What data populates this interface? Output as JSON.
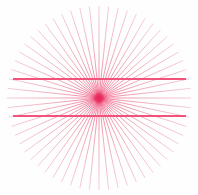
{
  "figure": {
    "type": "line-diagram",
    "canvas": {
      "width": 198,
      "height": 195,
      "background": "#fefefe"
    },
    "colors": {
      "ray": "#e8899f",
      "ray_faint": "#f0b9c7",
      "rule": "#f0547c",
      "center_hub": "#e8285c",
      "background": "#fefefe"
    },
    "center": {
      "x": 99,
      "y": 98
    },
    "rays": {
      "count": 60,
      "radius": 92,
      "start_angle_deg": 0,
      "angle_step_deg": 6,
      "stroke_width": 0.7,
      "color": "#e8899f",
      "label": "radiating-spokes"
    },
    "hub": {
      "radius": 6,
      "color": "#e8285c",
      "label": "convergence-point"
    },
    "rules": [
      {
        "label": "upper-horizontal-rule",
        "y": 79,
        "x1": 13,
        "x2": 186,
        "stroke_width": 1.8,
        "color": "#f0547c"
      },
      {
        "label": "lower-horizontal-rule",
        "y": 116,
        "x1": 13,
        "x2": 186,
        "stroke_width": 1.8,
        "color": "#f0547c"
      }
    ]
  }
}
